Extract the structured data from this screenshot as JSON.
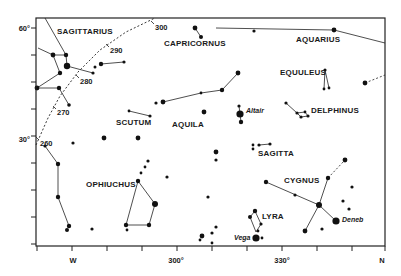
{
  "chart_data": {
    "type": "star-map",
    "title": "",
    "frame": {
      "x0": 36,
      "y0": 18,
      "x1": 385,
      "y1": 246
    },
    "x_axis": {
      "ticks_px": [
        37,
        72,
        107,
        142,
        177,
        212,
        247,
        282,
        317,
        352,
        385
      ],
      "labels": [
        {
          "text": "W",
          "x": 73
        },
        {
          "text": "300°",
          "x": 176
        },
        {
          "text": "330°",
          "x": 282
        },
        {
          "text": "N",
          "x": 382
        }
      ]
    },
    "y_axis": {
      "ticks_px": [
        28,
        55,
        82,
        109,
        136,
        163,
        190,
        217,
        244
      ],
      "labels": [
        {
          "text": "60°",
          "y": 28
        },
        {
          "text": "30°",
          "y": 139
        }
      ]
    },
    "ecliptic": {
      "points": [
        [
          36,
          145
        ],
        [
          48,
          118
        ],
        [
          60,
          96
        ],
        [
          78,
          72
        ],
        [
          100,
          50
        ],
        [
          126,
          32
        ],
        [
          155,
          18
        ]
      ],
      "labels": [
        {
          "text": "300",
          "x": 155,
          "y": 30
        },
        {
          "text": "290",
          "x": 110,
          "y": 53
        },
        {
          "text": "280",
          "x": 80,
          "y": 84
        },
        {
          "text": "270",
          "x": 57,
          "y": 115
        },
        {
          "text": "260",
          "x": 40,
          "y": 146
        }
      ]
    },
    "constellations": [
      {
        "name": "SAGITTARIUS",
        "label_x": 57,
        "label_y": 34
      },
      {
        "name": "CAPRICORNUS",
        "label_x": 164,
        "label_y": 46
      },
      {
        "name": "AQUARIUS",
        "label_x": 296,
        "label_y": 42
      },
      {
        "name": "EQUULEUS",
        "label_x": 280,
        "label_y": 75
      },
      {
        "name": "DELPHINUS",
        "label_x": 311,
        "label_y": 113
      },
      {
        "name": "SCUTUM",
        "label_x": 116,
        "label_y": 125
      },
      {
        "name": "AQUILA",
        "label_x": 172,
        "label_y": 127
      },
      {
        "name": "SAGITTA",
        "label_x": 258,
        "label_y": 156
      },
      {
        "name": "CYGNUS",
        "label_x": 284,
        "label_y": 183
      },
      {
        "name": "OPHIUCHUS",
        "label_x": 86,
        "label_y": 187
      },
      {
        "name": "LYRA",
        "label_x": 262,
        "label_y": 219
      }
    ],
    "named_stars": [
      {
        "name": "Altair",
        "x": 246,
        "y": 113
      },
      {
        "name": "Deneb",
        "x": 342,
        "y": 222
      },
      {
        "name": "Vega",
        "x": 234,
        "y": 240
      }
    ],
    "stars": [
      {
        "x": 53,
        "y": 55,
        "r": 2.4
      },
      {
        "x": 66,
        "y": 55,
        "r": 2.2
      },
      {
        "x": 67,
        "y": 66,
        "r": 3.2
      },
      {
        "x": 60,
        "y": 73,
        "r": 2.2
      },
      {
        "x": 37,
        "y": 88,
        "r": 2.4
      },
      {
        "x": 59,
        "y": 88,
        "r": 2.2
      },
      {
        "x": 69,
        "y": 105,
        "r": 1.8
      },
      {
        "x": 93,
        "y": 73,
        "r": 1.6
      },
      {
        "x": 95,
        "y": 67,
        "r": 1.5
      },
      {
        "x": 101,
        "y": 64,
        "r": 2.2
      },
      {
        "x": 124,
        "y": 62,
        "r": 1.6
      },
      {
        "x": 195,
        "y": 28,
        "r": 2.4
      },
      {
        "x": 201,
        "y": 37,
        "r": 2.0
      },
      {
        "x": 254,
        "y": 31,
        "r": 1.6
      },
      {
        "x": 334,
        "y": 30,
        "r": 2.4
      },
      {
        "x": 325,
        "y": 70,
        "r": 1.6
      },
      {
        "x": 324,
        "y": 89,
        "r": 1.4
      },
      {
        "x": 329,
        "y": 88,
        "r": 1.4
      },
      {
        "x": 365,
        "y": 83,
        "r": 2.4
      },
      {
        "x": 286,
        "y": 103,
        "r": 1.6
      },
      {
        "x": 297,
        "y": 113,
        "r": 1.6
      },
      {
        "x": 301,
        "y": 117,
        "r": 1.6
      },
      {
        "x": 305,
        "y": 112,
        "r": 1.4
      },
      {
        "x": 308,
        "y": 116,
        "r": 1.6
      },
      {
        "x": 156,
        "y": 103,
        "r": 1.6
      },
      {
        "x": 163,
        "y": 102,
        "r": 2.4
      },
      {
        "x": 201,
        "y": 93,
        "r": 1.4
      },
      {
        "x": 222,
        "y": 90,
        "r": 2.2
      },
      {
        "x": 238,
        "y": 73,
        "r": 2.4
      },
      {
        "x": 129,
        "y": 111,
        "r": 1.4
      },
      {
        "x": 150,
        "y": 116,
        "r": 1.6
      },
      {
        "x": 204,
        "y": 112,
        "r": 2.4
      },
      {
        "x": 239,
        "y": 106,
        "r": 1.6
      },
      {
        "x": 240,
        "y": 114,
        "r": 3.6
      },
      {
        "x": 241,
        "y": 122,
        "r": 2.2
      },
      {
        "x": 104,
        "y": 138,
        "r": 2.4
      },
      {
        "x": 138,
        "y": 138,
        "r": 2.4
      },
      {
        "x": 73,
        "y": 143,
        "r": 1.6
      },
      {
        "x": 148,
        "y": 161,
        "r": 1.6
      },
      {
        "x": 145,
        "y": 167,
        "r": 1.4
      },
      {
        "x": 141,
        "y": 173,
        "r": 1.4
      },
      {
        "x": 138,
        "y": 181,
        "r": 2.2
      },
      {
        "x": 155,
        "y": 204,
        "r": 3.0
      },
      {
        "x": 149,
        "y": 225,
        "r": 2.2
      },
      {
        "x": 126,
        "y": 225,
        "r": 2.2
      },
      {
        "x": 127,
        "y": 230,
        "r": 1.4
      },
      {
        "x": 167,
        "y": 177,
        "r": 1.6
      },
      {
        "x": 45,
        "y": 146,
        "r": 1.6
      },
      {
        "x": 58,
        "y": 164,
        "r": 2.2
      },
      {
        "x": 58,
        "y": 197,
        "r": 2.2
      },
      {
        "x": 69,
        "y": 226,
        "r": 2.2
      },
      {
        "x": 67,
        "y": 230,
        "r": 2.0
      },
      {
        "x": 92,
        "y": 229,
        "r": 1.6
      },
      {
        "x": 216,
        "y": 152,
        "r": 2.4
      },
      {
        "x": 216,
        "y": 160,
        "r": 1.6
      },
      {
        "x": 208,
        "y": 197,
        "r": 1.6
      },
      {
        "x": 202,
        "y": 236,
        "r": 2.4
      },
      {
        "x": 212,
        "y": 233,
        "r": 1.6
      },
      {
        "x": 216,
        "y": 227,
        "r": 1.6
      },
      {
        "x": 200,
        "y": 240,
        "r": 1.4
      },
      {
        "x": 253,
        "y": 145,
        "r": 1.4
      },
      {
        "x": 259,
        "y": 145,
        "r": 1.6
      },
      {
        "x": 253,
        "y": 149,
        "r": 1.4
      },
      {
        "x": 270,
        "y": 144,
        "r": 1.6
      },
      {
        "x": 266,
        "y": 182,
        "r": 2.2
      },
      {
        "x": 295,
        "y": 195,
        "r": 1.6
      },
      {
        "x": 319,
        "y": 205,
        "r": 3.0
      },
      {
        "x": 336,
        "y": 221,
        "r": 3.6
      },
      {
        "x": 328,
        "y": 178,
        "r": 2.2
      },
      {
        "x": 345,
        "y": 160,
        "r": 2.4
      },
      {
        "x": 352,
        "y": 187,
        "r": 1.6
      },
      {
        "x": 343,
        "y": 201,
        "r": 1.6
      },
      {
        "x": 349,
        "y": 209,
        "r": 1.6
      },
      {
        "x": 305,
        "y": 231,
        "r": 2.4
      },
      {
        "x": 322,
        "y": 229,
        "r": 1.6
      },
      {
        "x": 255,
        "y": 211,
        "r": 2.2
      },
      {
        "x": 250,
        "y": 217,
        "r": 2.0
      },
      {
        "x": 261,
        "y": 224,
        "r": 1.6
      },
      {
        "x": 258,
        "y": 231,
        "r": 1.4
      },
      {
        "x": 256,
        "y": 238,
        "r": 3.6
      },
      {
        "x": 262,
        "y": 238,
        "r": 1.4
      },
      {
        "x": 212,
        "y": 243,
        "r": 1.4
      }
    ],
    "lines": [
      [
        [
          45,
          18
        ],
        [
          66,
          55
        ]
      ],
      [
        [
          38,
          48
        ],
        [
          53,
          55
        ]
      ],
      [
        [
          53,
          55
        ],
        [
          66,
          55
        ]
      ],
      [
        [
          66,
          55
        ],
        [
          67,
          66
        ]
      ],
      [
        [
          53,
          55
        ],
        [
          60,
          73
        ]
      ],
      [
        [
          67,
          66
        ],
        [
          93,
          73
        ]
      ],
      [
        [
          60,
          73
        ],
        [
          37,
          88
        ]
      ],
      [
        [
          37,
          88
        ],
        [
          59,
          88
        ]
      ],
      [
        [
          59,
          88
        ],
        [
          69,
          105
        ]
      ],
      [
        [
          101,
          64
        ],
        [
          124,
          62
        ]
      ],
      [
        [
          195,
          28
        ],
        [
          201,
          37
        ]
      ],
      [
        [
          190,
          28
        ],
        [
          190,
          28
        ]
      ],
      [
        [
          216,
          28
        ],
        [
          334,
          30
        ]
      ],
      [
        [
          334,
          30
        ],
        [
          385,
          43
        ]
      ],
      [
        [
          325,
          70
        ],
        [
          324,
          89
        ]
      ],
      [
        [
          325,
          70
        ],
        [
          329,
          88
        ]
      ],
      [
        [
          286,
          103
        ],
        [
          297,
          113
        ]
      ],
      [
        [
          297,
          113
        ],
        [
          301,
          117
        ]
      ],
      [
        [
          301,
          117
        ],
        [
          308,
          116
        ]
      ],
      [
        [
          297,
          113
        ],
        [
          305,
          112
        ]
      ],
      [
        [
          305,
          112
        ],
        [
          308,
          116
        ]
      ],
      [
        [
          163,
          102
        ],
        [
          201,
          93
        ]
      ],
      [
        [
          201,
          93
        ],
        [
          222,
          90
        ]
      ],
      [
        [
          222,
          90
        ],
        [
          238,
          73
        ]
      ],
      [
        [
          129,
          111
        ],
        [
          150,
          116
        ]
      ],
      [
        [
          239,
          106
        ],
        [
          241,
          122
        ]
      ],
      [
        [
          259,
          145
        ],
        [
          270,
          144
        ]
      ],
      [
        [
          45,
          146
        ],
        [
          58,
          164
        ]
      ],
      [
        [
          58,
          164
        ],
        [
          58,
          197
        ]
      ],
      [
        [
          58,
          197
        ],
        [
          69,
          226
        ]
      ],
      [
        [
          138,
          181
        ],
        [
          126,
          225
        ]
      ],
      [
        [
          138,
          181
        ],
        [
          155,
          204
        ]
      ],
      [
        [
          155,
          204
        ],
        [
          149,
          225
        ]
      ],
      [
        [
          149,
          225
        ],
        [
          126,
          225
        ]
      ],
      [
        [
          266,
          182
        ],
        [
          319,
          205
        ]
      ],
      [
        [
          319,
          205
        ],
        [
          336,
          221
        ]
      ],
      [
        [
          328,
          178
        ],
        [
          319,
          205
        ]
      ],
      [
        [
          319,
          205
        ],
        [
          305,
          231
        ]
      ],
      [
        [
          255,
          211
        ],
        [
          261,
          224
        ]
      ],
      [
        [
          250,
          217
        ],
        [
          256,
          232
        ]
      ],
      [
        [
          255,
          211
        ],
        [
          250,
          217
        ]
      ],
      [
        [
          261,
          224
        ],
        [
          256,
          232
        ]
      ]
    ],
    "dashed_lines": [
      [
        [
          328,
          178
        ],
        [
          345,
          160
        ]
      ],
      [
        [
          365,
          83
        ],
        [
          385,
          75
        ]
      ]
    ]
  }
}
